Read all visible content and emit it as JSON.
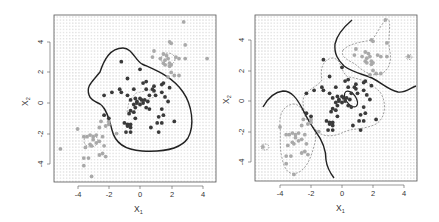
{
  "chart_data": [
    {
      "type": "scatter",
      "panel": "left",
      "title": "",
      "xlabel": "X1",
      "ylabel": "X2",
      "xlim": [
        -5.5,
        4.8
      ],
      "ylim": [
        -5.2,
        5.8
      ],
      "xticks": [
        -4,
        -2,
        0,
        2,
        4
      ],
      "yticks": [
        -4,
        -2,
        0,
        2,
        4
      ],
      "grid": "dotted background lattice (decision region shading)",
      "legend": "none",
      "series": [
        {
          "name": "class-dark",
          "color": "#333333"
        },
        {
          "name": "class-light",
          "color": "#aaaaaa"
        }
      ],
      "boundary": {
        "style": "solid",
        "description": "single closed nonlinear decision boundary enclosing central dark cluster"
      },
      "bayes_boundary": {
        "style": "dashed",
        "description": "small dashed contours around cluster centers"
      }
    },
    {
      "type": "scatter",
      "panel": "right",
      "title": "",
      "xlabel": "X1",
      "ylabel": "X2",
      "xlim": [
        -5.5,
        4.8
      ],
      "ylim": [
        -5.2,
        5.8
      ],
      "xticks": [
        -4,
        -2,
        0,
        2,
        4
      ],
      "yticks": [
        -4,
        -2,
        0,
        2,
        4
      ],
      "grid": "dotted background lattice (decision region shading)",
      "legend": "none",
      "series": [
        {
          "name": "class-dark",
          "color": "#333333"
        },
        {
          "name": "class-light",
          "color": "#aaaaaa"
        }
      ],
      "boundary": {
        "style": "solid",
        "description": "two wavy boundary curves separating diagonal light clusters from central dark cluster, plus small closed ellipse near (0.6, 0.3)"
      },
      "bayes_boundary": {
        "style": "dashed",
        "description": "dashed contours around the two light clusters and the dark cluster"
      }
    }
  ],
  "points": {
    "dark": [
      [
        -1.2,
        2.7
      ],
      [
        0.0,
        2.2
      ],
      [
        -0.8,
        1.6
      ],
      [
        0.2,
        1.3
      ],
      [
        0.4,
        1.4
      ],
      [
        0.9,
        1.1
      ],
      [
        0.8,
        0.9
      ],
      [
        1.5,
        1.3
      ],
      [
        1.4,
        1.2
      ],
      [
        1.9,
        1.0
      ],
      [
        -0.4,
        0.9
      ],
      [
        0.4,
        0.9
      ],
      [
        0.9,
        0.8
      ],
      [
        1.4,
        0.7
      ],
      [
        -1.2,
        0.7
      ],
      [
        -1.8,
        0.7
      ],
      [
        -2.3,
        0.5
      ],
      [
        -0.8,
        0.5
      ],
      [
        -0.6,
        0.2
      ],
      [
        -0.3,
        0.3
      ],
      [
        -0.2,
        0.1
      ],
      [
        0.0,
        0.3
      ],
      [
        0.1,
        0.2
      ],
      [
        0.3,
        0.2
      ],
      [
        -0.4,
        -0.1
      ],
      [
        0.0,
        -0.1
      ],
      [
        0.2,
        0.0
      ],
      [
        0.6,
        0.5
      ],
      [
        1.0,
        0.5
      ],
      [
        1.6,
        0.4
      ],
      [
        1.8,
        0.1
      ],
      [
        -0.6,
        -0.5
      ],
      [
        -0.3,
        -0.3
      ],
      [
        -0.4,
        -0.6
      ],
      [
        0.4,
        -0.3
      ],
      [
        1.4,
        -0.4
      ],
      [
        0.6,
        -0.4
      ],
      [
        1.2,
        -0.9
      ],
      [
        1.5,
        -0.8
      ],
      [
        -0.7,
        -0.7
      ],
      [
        -0.3,
        -1.0
      ],
      [
        -2.0,
        -1.0
      ],
      [
        -2.3,
        -0.8
      ],
      [
        1.1,
        -1.3
      ],
      [
        1.4,
        -1.3
      ],
      [
        2.2,
        -1.2
      ],
      [
        -1.0,
        -1.3
      ],
      [
        -0.8,
        -1.4
      ],
      [
        -0.6,
        -1.4
      ],
      [
        -0.6,
        -1.6
      ],
      [
        -0.8,
        -1.5
      ],
      [
        0.7,
        -1.6
      ],
      [
        -0.9,
        -1.9
      ],
      [
        -0.6,
        -1.9
      ],
      [
        1.2,
        -1.9
      ],
      [
        -0.2,
        0.0
      ],
      [
        0.5,
        0.1
      ],
      [
        -1.3,
        0.9
      ]
    ],
    "light": [
      [
        2.8,
        5.3
      ],
      [
        1.9,
        4.0
      ],
      [
        2.0,
        3.9
      ],
      [
        2.9,
        3.8
      ],
      [
        0.9,
        3.4
      ],
      [
        1.5,
        3.2
      ],
      [
        1.7,
        3.1
      ],
      [
        0.8,
        3.0
      ],
      [
        1.3,
        2.9
      ],
      [
        1.6,
        2.8
      ],
      [
        1.8,
        2.9
      ],
      [
        2.3,
        3.0
      ],
      [
        1.5,
        2.6
      ],
      [
        1.6,
        2.5
      ],
      [
        1.9,
        2.6
      ],
      [
        1.9,
        2.4
      ],
      [
        2.0,
        2.5
      ],
      [
        2.5,
        2.9
      ],
      [
        4.3,
        2.9
      ],
      [
        2.9,
        2.9
      ],
      [
        2.0,
        2.0
      ],
      [
        2.2,
        1.8
      ],
      [
        2.5,
        1.8
      ],
      [
        1.8,
        1.7
      ],
      [
        -4.0,
        -1.7
      ],
      [
        -3.6,
        -2.2
      ],
      [
        -3.4,
        -2.2
      ],
      [
        -3.2,
        -2.1
      ],
      [
        -3.0,
        -2.2
      ],
      [
        -2.8,
        -2.1
      ],
      [
        -3.0,
        -2.4
      ],
      [
        -3.2,
        -2.7
      ],
      [
        -3.5,
        -2.9
      ],
      [
        -3.1,
        -2.8
      ],
      [
        -2.8,
        -2.6
      ],
      [
        -2.4,
        -2.2
      ],
      [
        -2.6,
        -2.5
      ],
      [
        -2.2,
        -1.5
      ],
      [
        -2.0,
        -1.4
      ],
      [
        -2.6,
        -1.6
      ],
      [
        -2.5,
        -1.2
      ],
      [
        -2.3,
        -2.8
      ],
      [
        -3.6,
        -3.6
      ],
      [
        -3.3,
        -3.6
      ],
      [
        -3.6,
        -4.1
      ],
      [
        -2.6,
        -3.4
      ],
      [
        -2.4,
        -3.3
      ],
      [
        -2.2,
        -3.5
      ],
      [
        -3.1,
        -4.8
      ],
      [
        -5.1,
        -3.0
      ],
      [
        -2.0,
        -1.2
      ],
      [
        -1.5,
        -2.0
      ]
    ]
  },
  "left_panel": {
    "x_tick_labels": [
      "-4",
      "-2",
      "0",
      "2",
      "4"
    ],
    "y_tick_labels": [
      "-4",
      "-2",
      "0",
      "2",
      "4"
    ],
    "xlabel_main": "X",
    "xlabel_sub": "1",
    "ylabel_main": "X",
    "ylabel_sub": "2"
  },
  "right_panel": {
    "x_tick_labels": [
      "-4",
      "-2",
      "0",
      "2",
      "4"
    ],
    "y_tick_labels": [
      "-4",
      "-2",
      "0",
      "2",
      "4"
    ],
    "xlabel_main": "X",
    "xlabel_sub": "1",
    "ylabel_main": "X",
    "ylabel_sub": "2"
  },
  "colors": {
    "dark_point": "#3a3a3a",
    "light_point": "#a9a9a9",
    "boundary": "#222222",
    "dashed": "#777777",
    "frame": "#555555",
    "lattice": "#c9c9c9"
  }
}
